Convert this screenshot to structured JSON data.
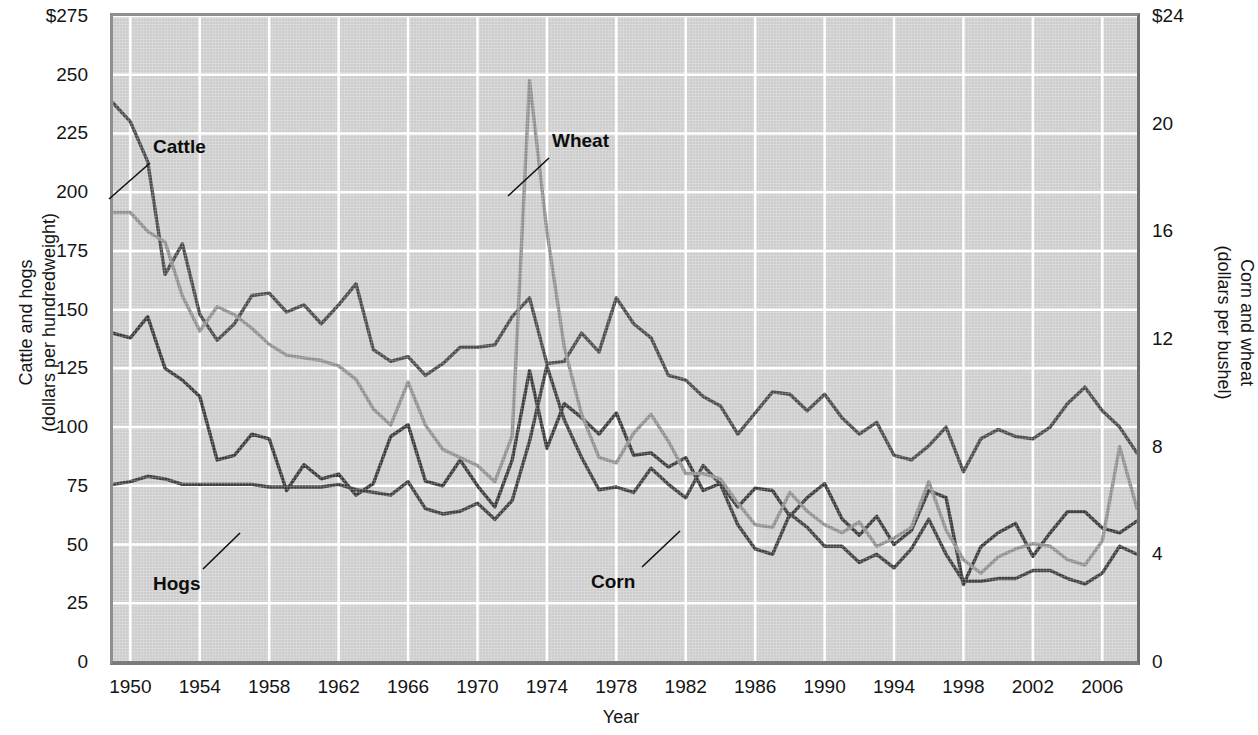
{
  "chart_data": {
    "type": "line",
    "title": "",
    "xlabel": "Year",
    "ylabel": "Cattle and hogs (dollars per hundredweight)",
    "y2label": "Corn and wheat (dollars per bushel)",
    "grid": true,
    "legend_position": "inline-annotations",
    "xlim": [
      1949,
      2008
    ],
    "ylim": [
      0,
      275
    ],
    "y2lim": [
      0,
      24
    ],
    "xticks": [
      1950,
      1954,
      1958,
      1962,
      1966,
      1970,
      1974,
      1978,
      1982,
      1986,
      1990,
      1994,
      1998,
      2002,
      2006
    ],
    "yticks": [
      "$275",
      "250",
      "225",
      "200",
      "175",
      "150",
      "125",
      "100",
      "75",
      "50",
      "25",
      "0"
    ],
    "ytick_values": [
      275,
      250,
      225,
      200,
      175,
      150,
      125,
      100,
      75,
      50,
      25,
      0
    ],
    "y2ticks": [
      "$24",
      "20",
      "16",
      "12",
      "8",
      "4",
      "0"
    ],
    "y2tick_values": [
      24,
      20,
      16,
      12,
      8,
      4,
      0
    ],
    "x": [
      1949,
      1950,
      1951,
      1952,
      1953,
      1954,
      1955,
      1956,
      1957,
      1958,
      1959,
      1960,
      1961,
      1962,
      1963,
      1964,
      1965,
      1966,
      1967,
      1968,
      1969,
      1970,
      1971,
      1972,
      1973,
      1974,
      1975,
      1976,
      1977,
      1978,
      1979,
      1980,
      1981,
      1982,
      1983,
      1984,
      1985,
      1986,
      1987,
      1988,
      1989,
      1990,
      1991,
      1992,
      1993,
      1994,
      1995,
      1996,
      1997,
      1998,
      1999,
      2000,
      2001,
      2002,
      2003,
      2004,
      2005,
      2006,
      2007,
      2008
    ],
    "series": [
      {
        "name": "Cattle",
        "axis": "left",
        "units": "dollars per hundredweight",
        "color": "#4a4a4a",
        "values": [
          238,
          230,
          213,
          165,
          178,
          148,
          137,
          144,
          156,
          157,
          149,
          152,
          144,
          152,
          161,
          133,
          128,
          130,
          122,
          127,
          134,
          134,
          135,
          147,
          155,
          127,
          128,
          140,
          132,
          155,
          144,
          138,
          122,
          120,
          113,
          109,
          97,
          106,
          115,
          114,
          107,
          114,
          104,
          97,
          102,
          88,
          86,
          92,
          100,
          81,
          95,
          99,
          96,
          95,
          100,
          110,
          117,
          107,
          100,
          89
        ]
      },
      {
        "name": "Hogs",
        "axis": "left",
        "units": "dollars per hundredweight",
        "color": "#3a3a3a",
        "values": [
          140,
          138,
          147,
          125,
          120,
          113,
          86,
          88,
          97,
          95,
          73,
          84,
          78,
          80,
          71,
          76,
          96,
          101,
          77,
          75,
          86,
          75,
          66,
          86,
          124,
          91,
          110,
          104,
          97,
          106,
          88,
          89,
          83,
          87,
          73,
          76,
          66,
          74,
          73,
          62,
          70,
          76,
          61,
          54,
          62,
          50,
          56,
          73,
          70,
          33,
          49,
          55,
          59,
          45,
          55,
          64,
          64,
          57,
          55,
          60
        ]
      },
      {
        "name": "Corn",
        "axis": "right",
        "units": "dollars per bushel",
        "color": "#3f3f3f",
        "values": [
          6.6,
          6.7,
          6.9,
          6.8,
          6.6,
          6.6,
          6.6,
          6.6,
          6.6,
          6.5,
          6.5,
          6.5,
          6.5,
          6.6,
          6.4,
          6.3,
          6.2,
          6.7,
          5.7,
          5.5,
          5.6,
          5.9,
          5.3,
          6.0,
          8.2,
          11.0,
          9.0,
          7.6,
          6.4,
          6.5,
          6.3,
          7.2,
          6.6,
          6.1,
          7.3,
          6.6,
          5.1,
          4.2,
          4.0,
          5.5,
          5.0,
          4.3,
          4.3,
          3.7,
          4.0,
          3.5,
          4.2,
          5.3,
          4.0,
          3.0,
          3.0,
          3.1,
          3.1,
          3.4,
          3.4,
          3.1,
          2.9,
          3.3,
          4.3,
          4.0
        ]
      },
      {
        "name": "Wheat",
        "axis": "right",
        "units": "dollars per bushel",
        "color": "#8f8f8f",
        "values": [
          16.7,
          16.7,
          16.0,
          15.6,
          13.6,
          12.3,
          13.2,
          12.9,
          12.4,
          11.8,
          11.4,
          11.3,
          11.2,
          11.0,
          10.5,
          9.4,
          8.8,
          10.4,
          8.8,
          7.9,
          7.6,
          7.3,
          6.7,
          8.4,
          21.6,
          16.0,
          11.7,
          9.2,
          7.6,
          7.4,
          8.5,
          9.2,
          8.2,
          7.0,
          7.0,
          6.8,
          5.9,
          5.1,
          5.0,
          6.3,
          5.6,
          5.1,
          4.8,
          5.2,
          4.3,
          4.6,
          5.0,
          6.7,
          4.9,
          3.8,
          3.3,
          3.9,
          4.2,
          4.4,
          4.3,
          3.8,
          3.6,
          4.5,
          8.0,
          5.7
        ]
      }
    ],
    "annotations": [
      {
        "text": "Cattle",
        "x_px": 153,
        "y_px": 137,
        "leader_from": [
          150,
          163
        ],
        "leader_to": [
          109,
          199
        ]
      },
      {
        "text": "Wheat",
        "x_px": 552,
        "y_px": 131,
        "leader_from": [
          549,
          158
        ],
        "leader_to": [
          508,
          196
        ]
      },
      {
        "text": "Hogs",
        "x_px": 153,
        "y_px": 574,
        "leader_from": [
          203,
          569
        ],
        "leader_to": [
          240,
          533
        ]
      },
      {
        "text": "Corn",
        "x_px": 591,
        "y_px": 572,
        "leader_from": [
          642,
          567
        ],
        "leader_to": [
          680,
          531
        ]
      }
    ]
  },
  "axes": {
    "x_title": "Year",
    "y_left_title_line1": "Cattle and hogs",
    "y_left_title_line2": "(dollars per hundredweight)",
    "y_right_title_line1": "Corn and wheat",
    "y_right_title_line2": "(dollars per bushel)"
  },
  "colors": {
    "plot_background": "#cdcdcd",
    "gridline": "#ffffff",
    "cattle": "#4a4a4a",
    "hogs": "#3a3a3a",
    "corn": "#3f3f3f",
    "wheat": "#8f8f8f"
  }
}
